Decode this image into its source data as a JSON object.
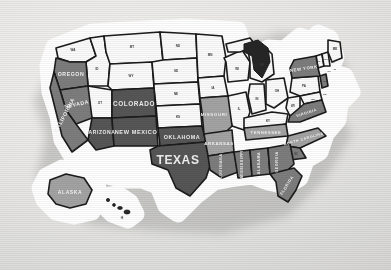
{
  "image": {
    "subject": "United States map sticker",
    "style": "die-cut vinyl sticker with white border and drop shadow, photographed on light gray surface",
    "background_color": "#e8e8e8",
    "sticker_border_color": "#ffffff",
    "outline_color": "#1a1a1a"
  },
  "palette": {
    "dark_gray": "#575757",
    "mid_gray": "#7d7d7d",
    "light_gray": "#a3a3a3",
    "white_state": "#fbfbfb",
    "lakes": "#262626",
    "label_light": "#f2f2f2",
    "label_dark": "#3a3a3a"
  },
  "named_states": [
    {
      "name": "OREGON",
      "shade": "mid_gray"
    },
    {
      "name": "NEVADA",
      "shade": "mid_gray"
    },
    {
      "name": "CALIFORNIA",
      "shade": "mid_gray"
    },
    {
      "name": "COLORADO",
      "shade": "dark_gray"
    },
    {
      "name": "ARIZONA",
      "shade": "dark_gray"
    },
    {
      "name": "NEW MEXICO",
      "shade": "dark_gray"
    },
    {
      "name": "OKLAHOMA",
      "shade": "dark_gray"
    },
    {
      "name": "TEXAS",
      "shade": "dark_gray"
    },
    {
      "name": "ALASKA",
      "shade": "light_gray"
    },
    {
      "name": "MISSOURI",
      "shade": "light_gray"
    },
    {
      "name": "ARKANSAS",
      "shade": "light_gray"
    },
    {
      "name": "LOUISIANA",
      "shade": "mid_gray"
    },
    {
      "name": "MISSISSIPPI",
      "shade": "mid_gray"
    },
    {
      "name": "ALABAMA",
      "shade": "mid_gray"
    },
    {
      "name": "GEORGIA",
      "shade": "mid_gray"
    },
    {
      "name": "FLORIDA",
      "shade": "mid_gray"
    },
    {
      "name": "TENNESSEE",
      "shade": "light_gray"
    },
    {
      "name": "NORTH CAROLINA",
      "shade": "light_gray"
    },
    {
      "name": "VIRGINIA",
      "shade": "mid_gray"
    },
    {
      "name": "NEW YORK",
      "shade": "mid_gray"
    }
  ],
  "labels": {
    "oregon": "OREGON",
    "nevada": "NEVADA",
    "california": "CALIFORNIA",
    "colorado": "COLORADO",
    "arizona": "ARIZONA",
    "new_mexico": "NEW MEXICO",
    "oklahoma": "OKLAHOMA",
    "texas": "TEXAS",
    "alaska": "ALASKA",
    "missouri": "MISSOURI",
    "arkansas": "ARKANSAS",
    "louisiana": "LOUISIANA",
    "mississippi": "MISSISSIPPI",
    "alabama": "ALABAMA",
    "georgia": "GEORGIA",
    "florida": "FLORIDA",
    "tennessee": "TENNESSEE",
    "north_carolina": "NORTH CAROLINA",
    "virginia": "VIRGINIA",
    "new_york": "NEW YORK"
  },
  "abbreviations": {
    "wa": "WA",
    "id": "ID",
    "mt": "MT",
    "nd": "ND",
    "mn": "MN",
    "wy": "WY",
    "sd": "SD",
    "wi": "WI",
    "mi": "MI",
    "ut": "UT",
    "ne": "NE",
    "ia": "IA",
    "il": "IL",
    "in": "IN",
    "oh": "OH",
    "ks": "KS",
    "ky": "KY",
    "wv": "WV",
    "pa": "PA",
    "sc": "SC",
    "md": "MD",
    "de": "DE",
    "nj": "NJ",
    "ct": "CT",
    "ri": "RI",
    "ma": "MA",
    "vt": "VT",
    "nh": "NH",
    "me": "ME",
    "hi": "HI"
  }
}
